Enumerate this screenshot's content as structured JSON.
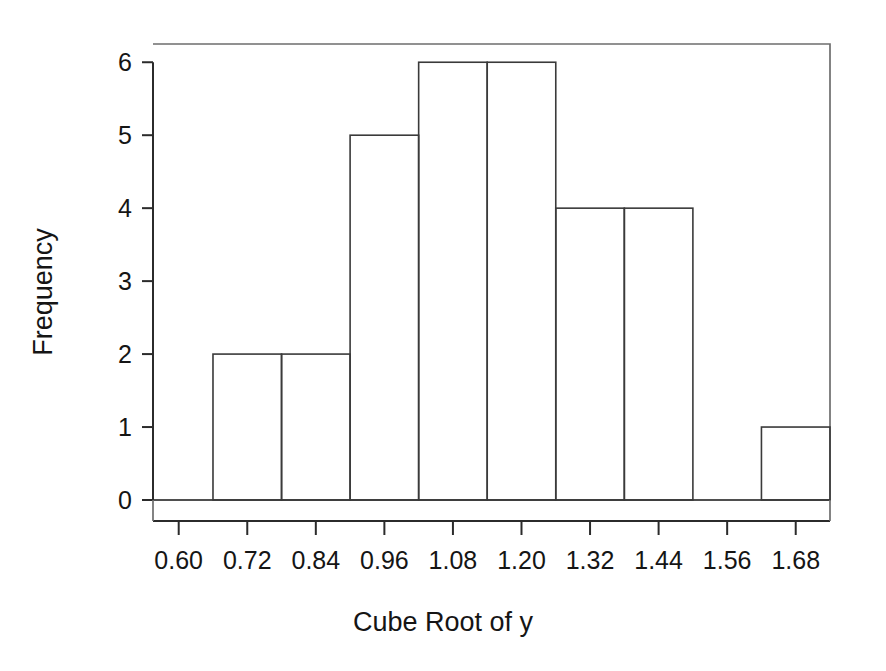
{
  "chart_data": {
    "type": "bar",
    "title": "",
    "subtitle": "",
    "xlabel": "Cube Root of y",
    "ylabel": "Frequency",
    "xlim": [
      0.555,
      1.74
    ],
    "ylim": [
      0,
      6.25
    ],
    "grid": false,
    "legend": null,
    "bin_width": 0.12,
    "categories": [
      "0.66-0.78",
      "0.78-0.90",
      "0.90-1.02",
      "1.02-1.14",
      "1.14-1.26",
      "1.26-1.38",
      "1.38-1.50",
      "1.50-1.62",
      "1.62-1.74"
    ],
    "bin_edges": [
      0.66,
      0.78,
      0.9,
      1.02,
      1.14,
      1.26,
      1.38,
      1.5,
      1.62,
      1.74
    ],
    "values": [
      2,
      2,
      5,
      6,
      6,
      4,
      4,
      0,
      1
    ],
    "bars": [
      {
        "left": 0.66,
        "right": 0.78,
        "height": 2
      },
      {
        "left": 0.78,
        "right": 0.9,
        "height": 2
      },
      {
        "left": 0.9,
        "right": 1.02,
        "height": 5
      },
      {
        "left": 1.02,
        "right": 1.14,
        "height": 6
      },
      {
        "left": 1.14,
        "right": 1.26,
        "height": 6
      },
      {
        "left": 1.26,
        "right": 1.38,
        "height": 4
      },
      {
        "left": 1.38,
        "right": 1.5,
        "height": 4
      },
      {
        "left": 1.5,
        "right": 1.62,
        "height": 0
      },
      {
        "left": 1.62,
        "right": 1.74,
        "height": 1
      }
    ],
    "x_ticks": [
      0.6,
      0.72,
      0.84,
      0.96,
      1.08,
      1.2,
      1.32,
      1.44,
      1.56,
      1.68
    ],
    "x_tick_labels": [
      "0.60",
      "0.72",
      "0.84",
      "0.96",
      "1.08",
      "1.20",
      "1.32",
      "1.44",
      "1.56",
      "1.68"
    ],
    "y_ticks": [
      0,
      1,
      2,
      3,
      4,
      5,
      6
    ],
    "y_tick_labels": [
      "0",
      "1",
      "2",
      "3",
      "4",
      "5",
      "6"
    ],
    "total_count": 30
  },
  "axis_titles": {
    "x": "Cube Root of y",
    "y": "Frequency"
  },
  "colors": {
    "background": "#ffffff",
    "bar_stroke": "#3a3a3a",
    "bar_fill": "none",
    "axis": "#2b2b2b",
    "frame": "#6e6e6e",
    "text": "#151515"
  }
}
